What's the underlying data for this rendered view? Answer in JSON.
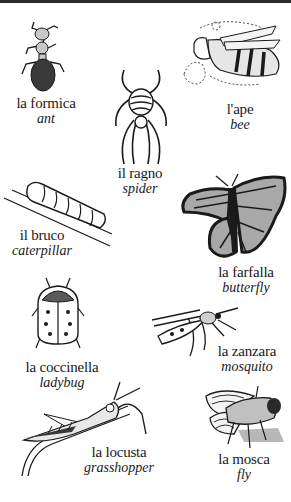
{
  "page": {
    "border_color": "#2a2a2a",
    "ink_color": "#1a1a1a",
    "shade_color": "#9a9a9a"
  },
  "insects": [
    {
      "id": "ant",
      "italian": "la formica",
      "english": "ant",
      "icon": "ant-icon"
    },
    {
      "id": "bee",
      "italian": "l'ape",
      "english": "bee",
      "icon": "bee-icon"
    },
    {
      "id": "spider",
      "italian": "il ragno",
      "english": "spider",
      "icon": "spider-icon"
    },
    {
      "id": "caterpillar",
      "italian": "il bruco",
      "english": "caterpillar",
      "icon": "caterpillar-icon"
    },
    {
      "id": "butterfly",
      "italian": "la farfalla",
      "english": "butterfly",
      "icon": "butterfly-icon"
    },
    {
      "id": "ladybug",
      "italian": "la coccinella",
      "english": "ladybug",
      "icon": "ladybug-icon"
    },
    {
      "id": "mosquito",
      "italian": "la zanzara",
      "english": "mosquito",
      "icon": "mosquito-icon"
    },
    {
      "id": "grasshopper",
      "italian": "la locusta",
      "english": "grasshopper",
      "icon": "grasshopper-icon"
    },
    {
      "id": "fly",
      "italian": "la mosca",
      "english": "fly",
      "icon": "fly-icon"
    }
  ]
}
